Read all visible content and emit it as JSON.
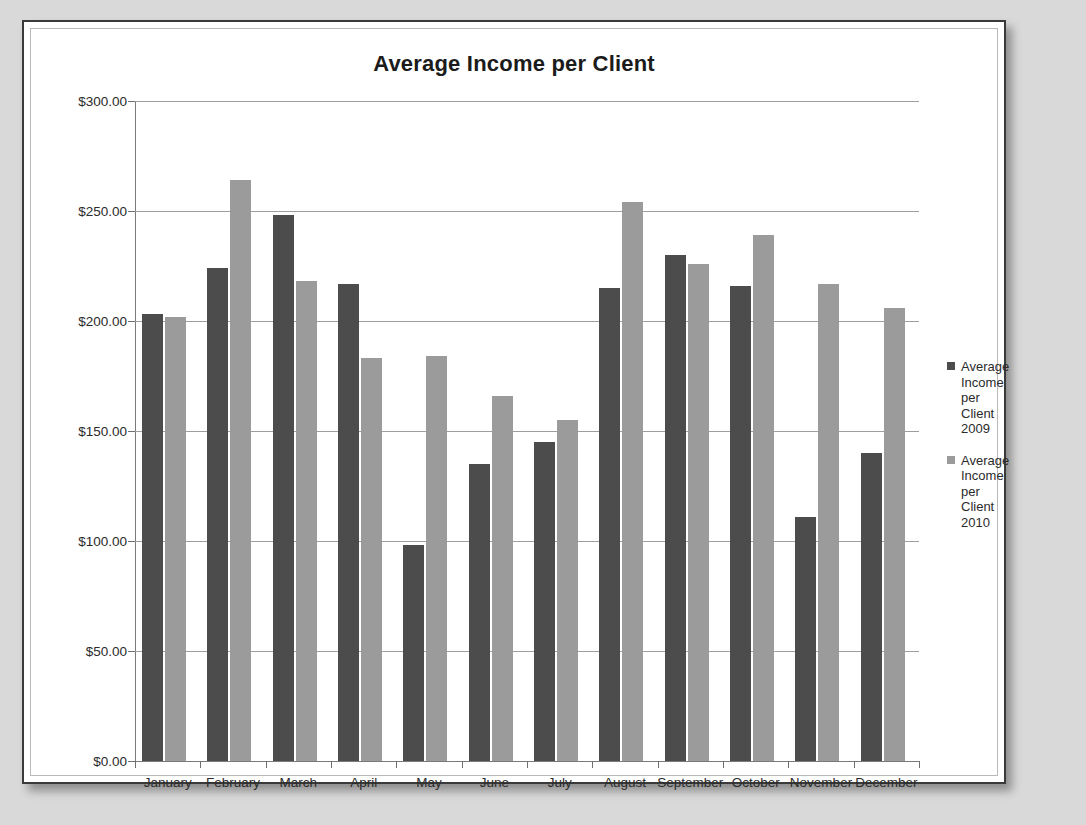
{
  "chart_data": {
    "type": "bar",
    "title": "Average Income per Client",
    "xlabel": "",
    "ylabel": "",
    "ylim": [
      0,
      300
    ],
    "ytick_step": 50,
    "grid": true,
    "legend_position": "right",
    "categories": [
      "January",
      "February",
      "March",
      "April",
      "May",
      "June",
      "July",
      "August",
      "September",
      "October",
      "November",
      "December"
    ],
    "ytick_labels": [
      "$300.00",
      "$250.00",
      "$200.00",
      "$150.00",
      "$100.00",
      "$50.00",
      "$0.00"
    ],
    "ytick_values": [
      300,
      250,
      200,
      150,
      100,
      50,
      0
    ],
    "series": [
      {
        "name": "Average Income per Client 2009",
        "color": "#4c4c4c",
        "values": [
          203,
          224,
          248,
          217,
          98,
          135,
          145,
          215,
          230,
          216,
          111,
          140
        ]
      },
      {
        "name": "Average Income per Client 2010",
        "color": "#9b9b9b",
        "values": [
          202,
          264,
          218,
          183,
          184,
          166,
          155,
          254,
          226,
          239,
          217,
          206
        ]
      }
    ]
  },
  "legend": {
    "entries": [
      {
        "label": "Average Income per Client 2009",
        "swatch": "legend-swatch-2009"
      },
      {
        "label": "Average Income per Client 2010",
        "swatch": "legend-swatch-2010"
      }
    ]
  }
}
